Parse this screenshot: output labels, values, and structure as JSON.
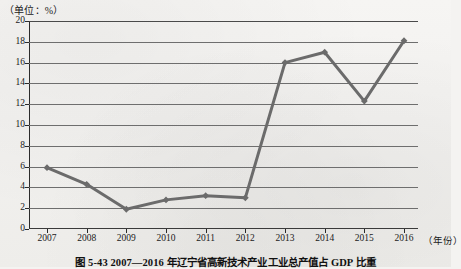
{
  "unit_label": "（单位：%）",
  "caption": "图 5-43  2007—2016 年辽宁省高新技术产业工业总产值占 GDP 比重",
  "xaxis_title": "（年份）",
  "colors": {
    "line": "#6b6b6b",
    "grid": "#6e6e6e",
    "axis": "#2b2b2b",
    "paper": "#f4f3f1",
    "text": "#1a1a1a"
  },
  "chart_data": {
    "type": "line",
    "title": "图 5-43  2007—2016 年辽宁省高新技术产业工业总产值占 GDP 比重",
    "xlabel": "（年份）",
    "ylabel": "（单位：%）",
    "categories": [
      "2007",
      "2008",
      "2009",
      "2010",
      "2011",
      "2012",
      "2013",
      "2014",
      "2015",
      "2016"
    ],
    "values": [
      5.9,
      4.3,
      1.9,
      2.8,
      3.2,
      3.0,
      16.0,
      17.0,
      12.3,
      18.1
    ],
    "series": [
      {
        "name": "高新技术产业工业总产值占GDP比重",
        "values": [
          5.9,
          4.3,
          1.9,
          2.8,
          3.2,
          3.0,
          16.0,
          17.0,
          12.3,
          18.1
        ]
      }
    ],
    "ylim": [
      0,
      20
    ],
    "yticks": [
      0,
      2,
      4,
      6,
      8,
      10,
      12,
      14,
      16,
      18,
      20
    ],
    "ytick_labels": [
      "0",
      "2",
      "4",
      "6",
      "8",
      "10",
      "12",
      "14",
      "16",
      "18",
      "20"
    ],
    "grid": true,
    "grid_axis": "y",
    "legend": false,
    "marker": "diamond",
    "line_color": "#6b6b6b",
    "line_width": 3
  }
}
